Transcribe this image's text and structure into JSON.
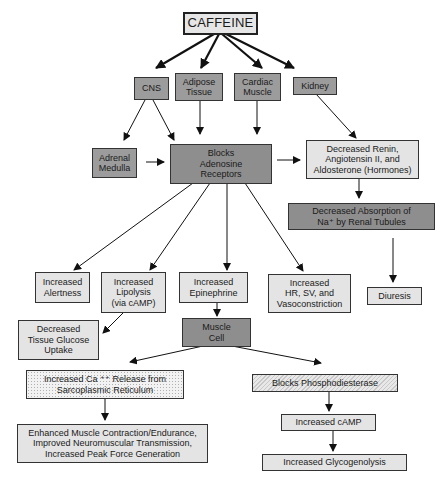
{
  "diagram": {
    "title": "CAFFEINE",
    "nodes": {
      "caffeine": "CAFFEINE",
      "cns": "CNS",
      "adipose": "Adipose\nTissue",
      "cardiac": "Cardiac\nMuscle",
      "kidney": "Kidney",
      "adrenal": "Adrenal\nMedulla",
      "adenosine": "Blocks\nAdenosine\nReceptors",
      "renin": "Decreased Renin,\nAngiotensin II, and\nAldosterone (Hormones)",
      "sodium": "Decreased Absorption of\nNa⁺ by Renal Tubules",
      "alertness": "Increased\nAlertness",
      "lipolysis": "Increased\nLipolysis\n(via cAMP)",
      "epinephrine": "Increased\nEpinephrine",
      "hr": "Increased\nHR, SV, and\nVasoconstriction",
      "diuresis": "Diuresis",
      "glucose": "Decreased\nTissue Glucose\nUptake",
      "muscle_cell": "Muscle\nCell",
      "calcium": "Increased Ca ⁺⁺ Release from\nSarcoplasmic Reticulum",
      "enhanced": "Enhanced Muscle Contraction/Endurance,\nImproved Neuromuscular Transmission,\nIncreased Peak Force Generation",
      "pde": "Blocks Phosphodiesterase",
      "camp": "Increased cAMP",
      "glycogenolysis": "Increased Glycogenolysis"
    },
    "edges": [
      [
        "caffeine",
        "cns"
      ],
      [
        "caffeine",
        "adipose"
      ],
      [
        "caffeine",
        "cardiac"
      ],
      [
        "caffeine",
        "kidney"
      ],
      [
        "cns",
        "adrenal"
      ],
      [
        "cns",
        "adenosine"
      ],
      [
        "adipose",
        "adenosine"
      ],
      [
        "cardiac",
        "adenosine"
      ],
      [
        "kidney",
        "renin"
      ],
      [
        "adrenal",
        "adenosine"
      ],
      [
        "adenosine",
        "renin"
      ],
      [
        "renin",
        "sodium"
      ],
      [
        "sodium",
        "diuresis"
      ],
      [
        "adenosine",
        "alertness"
      ],
      [
        "adenosine",
        "lipolysis"
      ],
      [
        "adenosine",
        "epinephrine"
      ],
      [
        "adenosine",
        "hr"
      ],
      [
        "lipolysis",
        "glucose"
      ],
      [
        "epinephrine",
        "muscle_cell"
      ],
      [
        "muscle_cell",
        "calcium"
      ],
      [
        "muscle_cell",
        "pde"
      ],
      [
        "calcium",
        "enhanced"
      ],
      [
        "pde",
        "camp"
      ],
      [
        "camp",
        "glycogenolysis"
      ]
    ],
    "colors": {
      "light_fill": "#e4e4e4",
      "mid_fill": "#9c9c9c",
      "dark_fill": "#8e8e8e",
      "line": "#111111"
    }
  }
}
